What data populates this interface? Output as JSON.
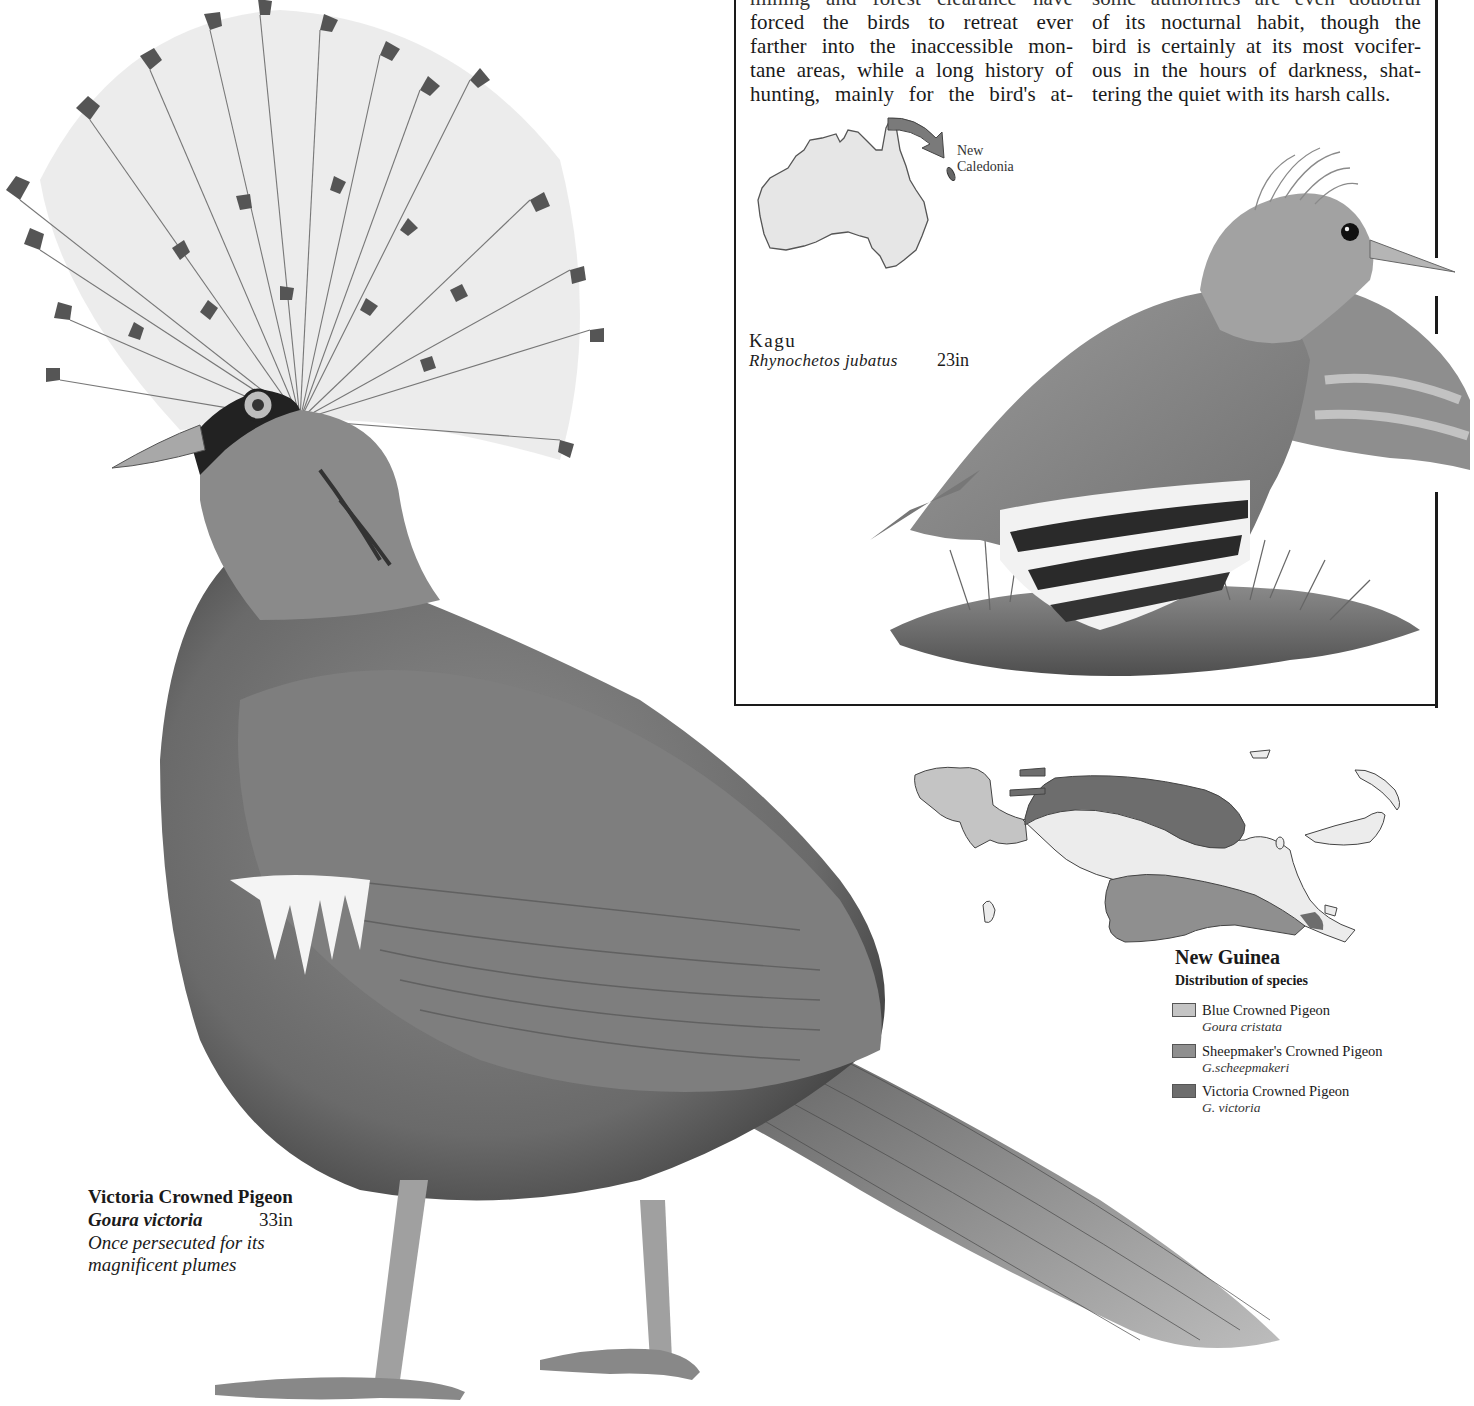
{
  "body_text": {
    "column_left": [
      "mining and forest clearance have",
      "forced the birds to retreat ever",
      "farther into the inaccessible mon-",
      "tane areas, while a long history of",
      "hunting, mainly for the bird's at-"
    ],
    "column_right": [
      "some authorities are even doubtful",
      "of its nocturnal habit, though the",
      "bird is certainly at its most vocifer-",
      "ous in the hours of darkness, shat-",
      "tering the quiet with its harsh calls."
    ]
  },
  "locator_map": {
    "label_line1": "New",
    "label_line2": "Caledonia",
    "land_fill": "#e6e6e6",
    "arrow_color": "#777777"
  },
  "kagu": {
    "common_name": "Kagu",
    "scientific_name": "Rhynochetos jubatus",
    "size": "23in"
  },
  "distribution_map": {
    "title": "New Guinea",
    "subtitle": "Distribution of species",
    "legend": [
      {
        "common_name": "Blue Crowned Pigeon",
        "scientific_name": "Goura cristata",
        "color": "#c4c4c4"
      },
      {
        "common_name": "Sheepmaker's Crowned Pigeon",
        "scientific_name": "G.scheepmakeri",
        "color": "#8f8f8f"
      },
      {
        "common_name": "Victoria Crowned Pigeon",
        "scientific_name": "G. victoria",
        "color": "#6d6d6d"
      }
    ],
    "neutral_color": "#ececec"
  },
  "victoria_pigeon": {
    "common_name": "Victoria Crowned Pigeon",
    "scientific_name": "Goura victoria",
    "size": "33in",
    "note_line1": "Once persecuted for its",
    "note_line2": "magnificent plumes"
  }
}
